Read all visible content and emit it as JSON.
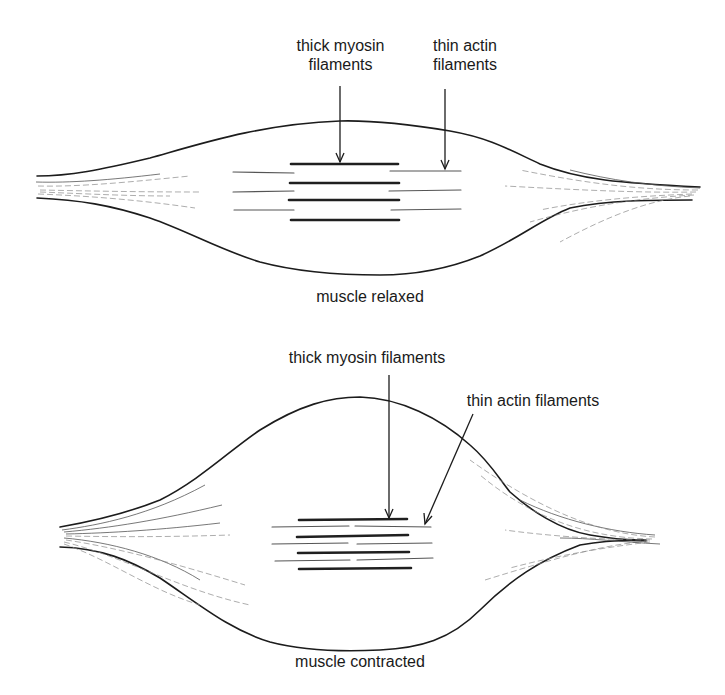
{
  "diagram": {
    "relaxed": {
      "caption": "muscle relaxed",
      "thick_label_line1": "thick myosin",
      "thick_label_line2": "filaments",
      "thin_label_line1": "thin actin",
      "thin_label_line2": "filaments"
    },
    "contracted": {
      "caption": "muscle contracted",
      "thick_label": "thick myosin filaments",
      "thin_label": "thin actin filaments"
    },
    "colors": {
      "stroke": "#1c1c1c",
      "background": "#ffffff"
    }
  }
}
